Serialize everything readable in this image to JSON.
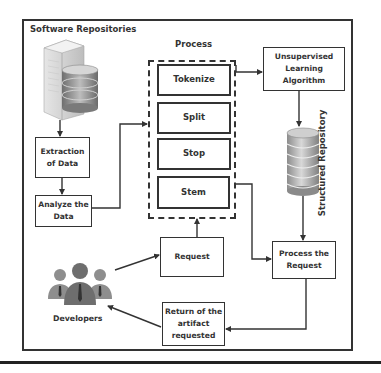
{
  "diagram": {
    "container_title": "Software Repositories",
    "process_title": "Process",
    "nodes": {
      "extraction": "Extraction\nof Data",
      "analyze": "Analyze the\nData",
      "tokenize": "Tokenize",
      "split": "Split",
      "stop": "Stop",
      "stem": "Stem",
      "unsupervised": "Unsupervised\nLearning\nAlgorithm",
      "structured_repository": "Structured Repository",
      "request": "Request",
      "process_request": "Process the\nRequest",
      "return_artifact": "Return of the\nartifact\nrequested",
      "developers": "Developers"
    },
    "icons": {
      "server": "server-database-icon",
      "database": "database-cylinder-icon",
      "developers": "people-group-icon"
    },
    "edges": [
      {
        "from": "Software Repositories",
        "to": "Extraction of Data"
      },
      {
        "from": "Extraction of Data",
        "to": "Analyze the Data"
      },
      {
        "from": "Analyze the Data",
        "to": "Process"
      },
      {
        "from": "Process",
        "to": "Unsupervised Learning Algorithm"
      },
      {
        "from": "Unsupervised Learning Algorithm",
        "to": "Structured Repository"
      },
      {
        "from": "Structured Repository",
        "to": "Process the Request"
      },
      {
        "from": "Process",
        "to": "Process the Request"
      },
      {
        "from": "Developers",
        "to": "Request"
      },
      {
        "from": "Request",
        "to": "Process"
      },
      {
        "from": "Process the Request",
        "to": "Return of the artifact requested"
      },
      {
        "from": "Return of the artifact requested",
        "to": "Developers"
      }
    ],
    "colors": {
      "stroke": "#333333",
      "background": "#ffffff",
      "icon_gray": "#9a9a9a"
    }
  }
}
